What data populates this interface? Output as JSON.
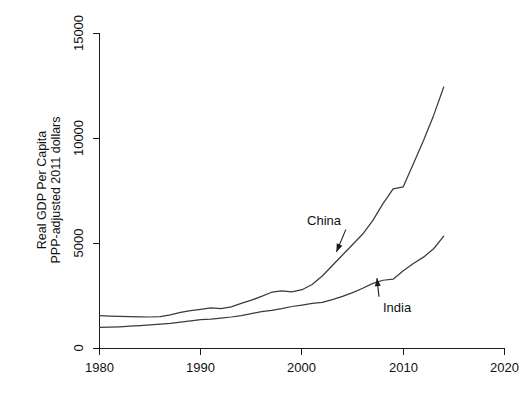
{
  "chart_data": {
    "type": "line",
    "title": "",
    "xlabel": "",
    "ylabel": "Real GDP Per Capita\nPPP-adjusted 2011 dollars",
    "ylabel_line1": "Real GDP Per Capita",
    "ylabel_line2": "PPP-adjusted 2011 dollars",
    "xlim": [
      1980,
      2020
    ],
    "ylim": [
      0,
      15000
    ],
    "xticks": [
      1980,
      1990,
      2000,
      2010,
      2020
    ],
    "xtick_labels": [
      "1980",
      "1990",
      "2000",
      "2010",
      "2020"
    ],
    "yticks": [
      0,
      5000,
      10000,
      15000
    ],
    "ytick_labels": [
      "0",
      "5000",
      "10000",
      "15000"
    ],
    "grid": false,
    "legend": "none",
    "annotations": [
      {
        "text": "China",
        "x": 2000.5,
        "y": 5900,
        "target_x": 2003.4,
        "target_y": 4600
      },
      {
        "text": "India",
        "x": 2008.0,
        "y": 1750,
        "target_x": 2007.4,
        "target_y": 3350
      }
    ],
    "series": [
      {
        "name": "China",
        "color": "#3b3b3b",
        "x": [
          1980,
          1981,
          1982,
          1983,
          1984,
          1985,
          1986,
          1987,
          1988,
          1989,
          1990,
          1991,
          1992,
          1993,
          1994,
          1995,
          1996,
          1997,
          1998,
          1999,
          2000,
          2001,
          2002,
          2003,
          2004,
          2005,
          2006,
          2007,
          2008,
          2009,
          2010,
          2011,
          2012,
          2013,
          2014
        ],
        "values": [
          1560,
          1545,
          1530,
          1520,
          1505,
          1500,
          1520,
          1600,
          1720,
          1800,
          1860,
          1930,
          1900,
          1980,
          2150,
          2300,
          2480,
          2680,
          2740,
          2700,
          2800,
          3050,
          3450,
          3950,
          4450,
          4950,
          5450,
          6100,
          6900,
          7600,
          7700,
          8800,
          9900,
          11100,
          12450
        ]
      },
      {
        "name": "India",
        "color": "#3b3b3b",
        "x": [
          1980,
          1981,
          1982,
          1983,
          1984,
          1985,
          1986,
          1987,
          1988,
          1989,
          1990,
          1991,
          1992,
          1993,
          1994,
          1995,
          1996,
          1997,
          1998,
          1999,
          2000,
          2001,
          2002,
          2003,
          2004,
          2005,
          2006,
          2007,
          2008,
          2009,
          2010,
          2011,
          2012,
          2013,
          2014
        ],
        "values": [
          1010,
          1020,
          1035,
          1060,
          1085,
          1120,
          1160,
          1200,
          1260,
          1320,
          1380,
          1400,
          1450,
          1500,
          1570,
          1660,
          1760,
          1820,
          1900,
          2000,
          2070,
          2150,
          2200,
          2330,
          2480,
          2660,
          2870,
          3100,
          3250,
          3300,
          3700,
          4050,
          4350,
          4750,
          5350
        ]
      }
    ]
  }
}
